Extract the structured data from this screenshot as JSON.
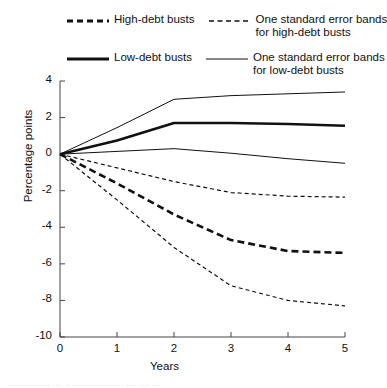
{
  "chart_data": {
    "type": "line",
    "title": "",
    "xlabel": "Years",
    "ylabel": "Percentage points",
    "xlim": [
      0,
      5
    ],
    "ylim": [
      -10,
      4
    ],
    "x": [
      0,
      1,
      2,
      3,
      4,
      5
    ],
    "xticks": [
      "0",
      "1",
      "2",
      "3",
      "4",
      "5"
    ],
    "yticks": [
      "4",
      "2",
      "0",
      "-2",
      "-4",
      "-6",
      "-8",
      "-10"
    ],
    "grid": false,
    "legend_position": "top",
    "series": [
      {
        "name": "High-debt busts",
        "style": "thick-dashed",
        "values": [
          0,
          -1.6,
          -3.3,
          -4.7,
          -5.3,
          -5.4
        ]
      },
      {
        "name": "Low-debt busts",
        "style": "thick-solid",
        "values": [
          0,
          0.75,
          1.7,
          1.7,
          1.65,
          1.55
        ]
      },
      {
        "name": "One standard error bands for high-debt busts (upper)",
        "style": "thin-dashed",
        "values": [
          0,
          -0.75,
          -1.5,
          -2.1,
          -2.3,
          -2.35
        ]
      },
      {
        "name": "One standard error bands for high-debt busts (lower)",
        "style": "thin-dashed",
        "values": [
          0,
          -2.5,
          -5.1,
          -7.2,
          -8.0,
          -8.3
        ]
      },
      {
        "name": "One standard error bands for low-debt busts (upper)",
        "style": "thin-solid",
        "values": [
          0,
          1.45,
          3.0,
          3.2,
          3.3,
          3.4
        ]
      },
      {
        "name": "One standard error bands for low-debt busts (lower)",
        "style": "thin-solid",
        "values": [
          0,
          0.15,
          0.3,
          0.05,
          -0.25,
          -0.5
        ]
      }
    ]
  },
  "legend": {
    "items": [
      {
        "key": "thick-dashed",
        "label": "High-debt busts"
      },
      {
        "key": "thin-dashed",
        "label_line1": "One standard error bands",
        "label_line2": "for high-debt busts"
      },
      {
        "key": "thick-solid",
        "label": "Low-debt busts"
      },
      {
        "key": "thin-solid",
        "label_line1": "One standard error bands",
        "label_line2": "for low-debt busts"
      }
    ]
  },
  "caption": {
    "sliver_text": "................  ....    ......................  ....  ....    ..."
  }
}
